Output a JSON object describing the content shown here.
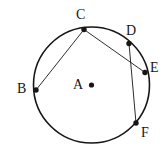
{
  "figure": {
    "background_color": "#ffffff",
    "stroke_color": "#161616",
    "label_color": "#161616",
    "width": 167,
    "height": 150
  },
  "circle": {
    "center_label": "A",
    "center_x": 91.5,
    "center_y": 85,
    "radius": 58,
    "stroke_width": 1.6
  },
  "center_point": {
    "label": "A",
    "x": 91.5,
    "y": 85,
    "dot_radius": 2.6,
    "label_x": 73,
    "label_y": 78
  },
  "points": [
    {
      "label": "B",
      "x": 36.0,
      "y": 90.0,
      "label_x": 17,
      "label_y": 82,
      "dot_radius": 2.7
    },
    {
      "label": "C",
      "x": 84.0,
      "y": 29.5,
      "label_x": 76,
      "label_y": 8,
      "dot_radius": 2.7
    },
    {
      "label": "D",
      "x": 129.0,
      "y": 43.5,
      "label_x": 126,
      "label_y": 24,
      "dot_radius": 2.7
    },
    {
      "label": "E",
      "x": 145.0,
      "y": 72.5,
      "label_x": 150,
      "label_y": 61,
      "dot_radius": 2.7
    },
    {
      "label": "F",
      "x": 136.0,
      "y": 123.0,
      "label_x": 141,
      "label_y": 126,
      "dot_radius": 2.7
    }
  ],
  "chords": [
    {
      "name": "chord-C-B",
      "from": "C",
      "to": "B",
      "x1": 84.0,
      "y1": 29.5,
      "x2": 36.0,
      "y2": 90.0,
      "stroke_width": 0.9
    },
    {
      "name": "chord-C-E",
      "from": "C",
      "to": "E",
      "x1": 84.0,
      "y1": 29.5,
      "x2": 145.0,
      "y2": 72.5,
      "stroke_width": 0.9
    },
    {
      "name": "chord-D-F",
      "from": "D",
      "to": "F",
      "x1": 129.0,
      "y1": 43.5,
      "x2": 136.0,
      "y2": 123.0,
      "stroke_width": 0.9
    }
  ]
}
